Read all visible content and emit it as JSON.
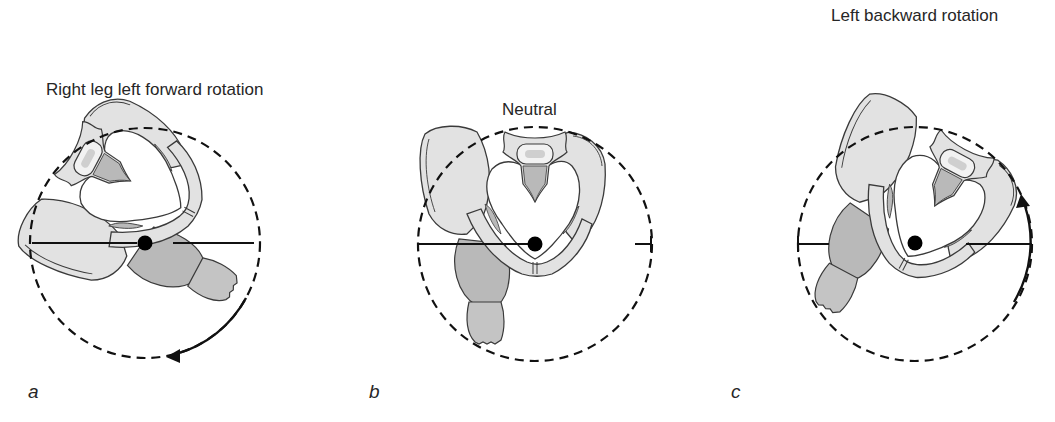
{
  "figure": {
    "panels": [
      {
        "id": "a",
        "label": "a",
        "title": "Right leg left forward rotation",
        "rotation": "left-forward",
        "arrow_direction": "counterclockwise-bottom"
      },
      {
        "id": "b",
        "label": "b",
        "title": "Neutral",
        "rotation": "none"
      },
      {
        "id": "c",
        "label": "c",
        "title": "Left backward rotation",
        "rotation": "left-backward",
        "arrow_direction": "upward-right"
      }
    ],
    "colors": {
      "bone_fill": "#e2e2e2",
      "bone_shade": "#b9b9b9",
      "outline": "#3a3a3a",
      "dashed_circle": "#111111",
      "axis_line": "#111111",
      "pivot_dot": "#000000"
    }
  }
}
